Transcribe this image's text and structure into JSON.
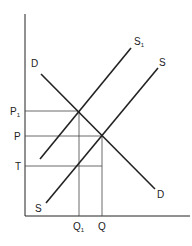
{
  "diagram": {
    "type": "supply-demand",
    "axes": {
      "origin": [
        25,
        216
      ],
      "y_top": 14,
      "x_right": 190
    },
    "colors": {
      "line": "#222222",
      "guide": "#444444",
      "background": "#ffffff"
    },
    "curves": [
      {
        "id": "D",
        "label": "D",
        "from": [
          41,
          74
        ],
        "to": [
          155,
          189
        ],
        "label_top": {
          "text": "D",
          "x": 31,
          "y": 67
        },
        "label_bottom": {
          "text": "D",
          "x": 157,
          "y": 198
        }
      },
      {
        "id": "S1",
        "label": "S",
        "sub": "1",
        "from": [
          40,
          159
        ],
        "to": [
          131,
          48
        ],
        "label_pos": {
          "x": 134,
          "y": 45
        }
      },
      {
        "id": "S",
        "label": "S",
        "from": [
          46,
          203
        ],
        "to": [
          158,
          68
        ],
        "label_pos": {
          "x": 159,
          "y": 66
        },
        "label_bottom": {
          "text": "S",
          "x": 35,
          "y": 212
        }
      }
    ],
    "price_levels": [
      {
        "label": "P",
        "sub": "1",
        "y": 111,
        "x_end": 78
      },
      {
        "label": "P",
        "y": 136,
        "x_end": 102
      },
      {
        "label": "T",
        "y": 166,
        "x_end": 102
      }
    ],
    "quantity_levels": [
      {
        "label": "Q",
        "sub": "1",
        "x": 79,
        "y_top": 111
      },
      {
        "label": "Q",
        "x": 102,
        "y_top": 136
      }
    ]
  }
}
